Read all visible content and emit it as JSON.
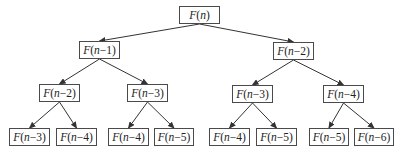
{
  "diagram": {
    "edge_color": "#333333",
    "nodes": [
      {
        "id": "n0",
        "fn": "F",
        "arg": "n",
        "label": "F(n)",
        "x": 179,
        "y": 6,
        "w": 41,
        "h": 18
      },
      {
        "id": "n1",
        "fn": "F",
        "arg": "n−1",
        "label": "F(n−1)",
        "x": 79,
        "y": 41,
        "w": 41,
        "h": 18
      },
      {
        "id": "n2",
        "fn": "F",
        "arg": "n−2",
        "label": "F(n−2)",
        "x": 273,
        "y": 42,
        "w": 41,
        "h": 18
      },
      {
        "id": "n3",
        "fn": "F",
        "arg": "n−2",
        "label": "F(n−2)",
        "x": 39,
        "y": 84,
        "w": 41,
        "h": 18
      },
      {
        "id": "n4",
        "fn": "F",
        "arg": "n−3",
        "label": "F(n−3)",
        "x": 127,
        "y": 84,
        "w": 41,
        "h": 18
      },
      {
        "id": "n5",
        "fn": "F",
        "arg": "n−3",
        "label": "F(n−3)",
        "x": 232,
        "y": 85,
        "w": 41,
        "h": 18
      },
      {
        "id": "n6",
        "fn": "F",
        "arg": "n−4",
        "label": "F(n−4)",
        "x": 323,
        "y": 85,
        "w": 41,
        "h": 18
      },
      {
        "id": "n7",
        "fn": "F",
        "arg": "n−3",
        "label": "F(n−3)",
        "x": 9,
        "y": 128,
        "w": 41,
        "h": 18
      },
      {
        "id": "n8",
        "fn": "F",
        "arg": "n−4",
        "label": "F(n−4)",
        "x": 56,
        "y": 128,
        "w": 41,
        "h": 18
      },
      {
        "id": "n9",
        "fn": "F",
        "arg": "n−4",
        "label": "F(n−4)",
        "x": 108,
        "y": 128,
        "w": 41,
        "h": 18
      },
      {
        "id": "n10",
        "fn": "F",
        "arg": "n−5",
        "label": "F(n−5)",
        "x": 154,
        "y": 128,
        "w": 40,
        "h": 18
      },
      {
        "id": "n11",
        "fn": "F",
        "arg": "n−4",
        "label": "F(n−4)",
        "x": 209,
        "y": 128,
        "w": 41,
        "h": 18
      },
      {
        "id": "n12",
        "fn": "F",
        "arg": "n−5",
        "label": "F(n−5)",
        "x": 256,
        "y": 128,
        "w": 41,
        "h": 18
      },
      {
        "id": "n13",
        "fn": "F",
        "arg": "n−5",
        "label": "F(n−5)",
        "x": 309,
        "y": 128,
        "w": 40,
        "h": 18
      },
      {
        "id": "n14",
        "fn": "F",
        "arg": "n−6",
        "label": "F(n−6)",
        "x": 354,
        "y": 128,
        "w": 40,
        "h": 18
      }
    ],
    "edges": [
      {
        "from": "n0",
        "to": "n1"
      },
      {
        "from": "n0",
        "to": "n2"
      },
      {
        "from": "n1",
        "to": "n3"
      },
      {
        "from": "n1",
        "to": "n4"
      },
      {
        "from": "n2",
        "to": "n5"
      },
      {
        "from": "n2",
        "to": "n6"
      },
      {
        "from": "n3",
        "to": "n7"
      },
      {
        "from": "n3",
        "to": "n8"
      },
      {
        "from": "n4",
        "to": "n9"
      },
      {
        "from": "n4",
        "to": "n10"
      },
      {
        "from": "n5",
        "to": "n11"
      },
      {
        "from": "n5",
        "to": "n12"
      },
      {
        "from": "n6",
        "to": "n13"
      },
      {
        "from": "n6",
        "to": "n14"
      }
    ]
  }
}
